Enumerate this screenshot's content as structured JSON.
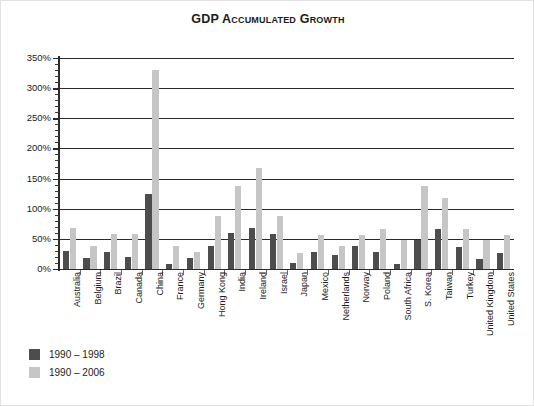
{
  "chart_data": {
    "type": "bar",
    "title": "GDP Accumulated Growth",
    "xlabel": "",
    "ylabel": "",
    "ylim": [
      0,
      350
    ],
    "ytick_step": 50,
    "ytick_labels": [
      "0%",
      "50%",
      "100%",
      "150%",
      "200%",
      "250%",
      "300%",
      "350%"
    ],
    "ytick_values": [
      0,
      50,
      100,
      150,
      200,
      250,
      300,
      350
    ],
    "grid": true,
    "legend_position": "bottom-left",
    "categories": [
      "Australia",
      "Belgium",
      "Brazil",
      "Canada",
      "China",
      "France",
      "Germany",
      "Hong Kong",
      "India",
      "Ireland",
      "Israel",
      "Japan",
      "Mexico",
      "Netherlands",
      "Norway",
      "Poland",
      "South Africa",
      "S. Korea",
      "Taiwan",
      "Turkey",
      "United Kingdom",
      "United States"
    ],
    "series": [
      {
        "name": "1990 – 1998",
        "color": "#4d4d4d",
        "values": [
          30,
          19,
          29,
          20,
          125,
          9,
          19,
          39,
          59,
          68,
          58,
          10,
          29,
          23,
          38,
          28,
          8,
          48,
          67,
          37,
          17,
          27
        ]
      },
      {
        "name": "1990 – 2006",
        "color": "#c6c6c6",
        "values": [
          68,
          39,
          58,
          58,
          330,
          39,
          28,
          88,
          138,
          168,
          88,
          27,
          57,
          38,
          56,
          67,
          48,
          137,
          118,
          67,
          48,
          56
        ]
      }
    ]
  },
  "legend": {
    "items": [
      {
        "label": "1990 – 1998",
        "color": "#4d4d4d"
      },
      {
        "label": "1990 – 2006",
        "color": "#c6c6c6"
      }
    ]
  }
}
